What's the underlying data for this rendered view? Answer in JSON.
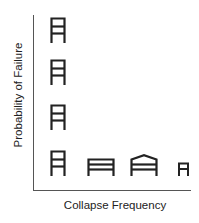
{
  "diagram": {
    "y_axis_label": "Probability of Failure",
    "x_axis_label": "Collapse Frequency",
    "stroke_color": "#222222",
    "axis_color": "#555555",
    "vertical_column_icons": [
      {
        "type": "tall-narrow-frame",
        "stories": 2
      },
      {
        "type": "tall-narrow-frame",
        "stories": 2
      },
      {
        "type": "tall-narrow-frame",
        "stories": 2
      },
      {
        "type": "tall-narrow-frame",
        "stories": 2
      }
    ],
    "bottom_row_icons": [
      {
        "type": "tall-narrow-frame",
        "stories": 2
      },
      {
        "type": "wide-low-frame",
        "stories": 2
      },
      {
        "type": "wide-gabled-frame",
        "stories": 2
      },
      {
        "type": "small-narrow-frame",
        "stories": 1
      }
    ]
  }
}
